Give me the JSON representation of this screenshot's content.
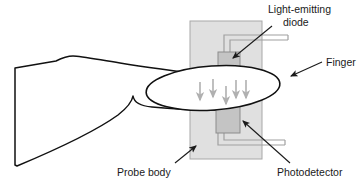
{
  "diagram": {
    "labels": {
      "led_line1": "Light-emitting",
      "led_line2": "diode",
      "finger": "Finger",
      "probe_body": "Probe body",
      "photodetector": "Photodetector"
    },
    "parts": {
      "probe_body_name": "probe-body",
      "led_name": "light-emitting-diode",
      "photodetector_name": "photodetector",
      "finger_name": "finger",
      "hand_name": "hand",
      "light_arrows_name": "light-ray-arrows"
    },
    "colors": {
      "outline": "#111111",
      "probe_body_fill": "#e0e0e0",
      "probe_body_stroke": "#9a9a9a",
      "component_fill": "#c4c4c4",
      "component_stroke": "#8a8a8a",
      "wire_stroke": "#9a9a9a",
      "arrow_gray": "#b0b0b0",
      "label_text": "#1a1a1a",
      "background": "#ffffff"
    },
    "light_arrow_count": 5
  }
}
